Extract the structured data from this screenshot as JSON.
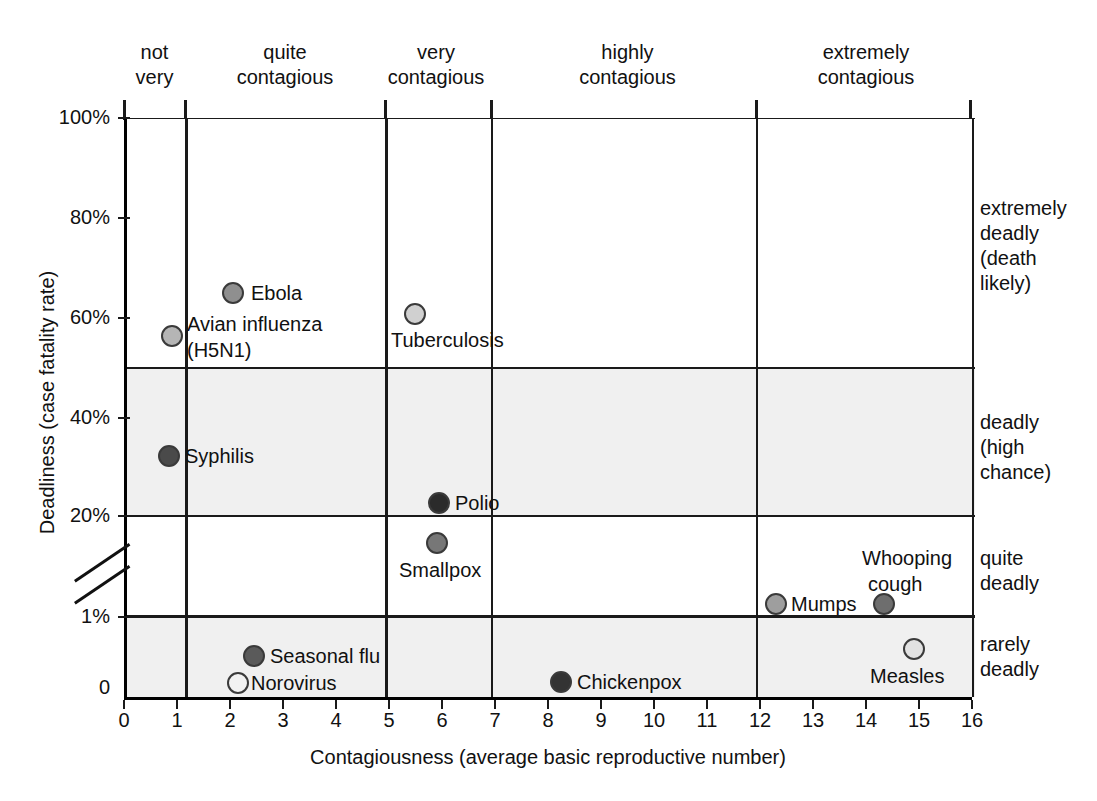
{
  "chart_data": {
    "type": "scatter",
    "title": "",
    "xlabel": "Contagiousness (average basic reproductive number)",
    "ylabel": "Deadliness (case fatality rate)",
    "xlim": [
      0,
      16
    ],
    "xticks": [
      "0",
      "1",
      "2",
      "3",
      "4",
      "5",
      "6",
      "7",
      "8",
      "9",
      "10",
      "11",
      "12",
      "13",
      "14",
      "15",
      "16"
    ],
    "yticks": [
      "100%",
      "80%",
      "60%",
      "40%",
      "20%",
      "1%",
      "0"
    ],
    "y_axis_note": "broken axis between 20% and 1%",
    "grid": true,
    "legend": "none",
    "points": [
      {
        "name": "Ebola",
        "x": 2.0,
        "y": 70,
        "color": "#8f8f8f",
        "label_pos": "right"
      },
      {
        "name": "Avian influenza\n(H5N1)",
        "x": 0.85,
        "y": 61.5,
        "color": "#b5b5b5",
        "label_pos": "right"
      },
      {
        "name": "Tuberculosis",
        "x": 5.45,
        "y": 65.5,
        "color": "#d0d0d0",
        "label_pos": "below"
      },
      {
        "name": "Syphilis",
        "x": 0.8,
        "y": 32.5,
        "color": "#4a4a4a",
        "label_pos": "right"
      },
      {
        "name": "Polio",
        "x": 5.9,
        "y": 22.5,
        "color": "#2b2b2b",
        "label_pos": "right"
      },
      {
        "name": "Smallpox",
        "x": 5.85,
        "y": 17.5,
        "color": "#777777",
        "label_pos": "below"
      },
      {
        "name": "Mumps",
        "x": 12.25,
        "y": 1.3,
        "color": "#9e9e9e",
        "label_pos": "right"
      },
      {
        "name": "Whooping\ncough",
        "x": 14.3,
        "y": 1.3,
        "color": "#6e6e6e",
        "label_pos": "above"
      },
      {
        "name": "Measles",
        "x": 14.85,
        "y": 0.55,
        "color": "#e2e2e2",
        "label_pos": "below"
      },
      {
        "name": "Seasonal flu",
        "x": 2.4,
        "y": 0.45,
        "color": "#5a5a5a",
        "label_pos": "right"
      },
      {
        "name": "Norovirus",
        "x": 2.1,
        "y": 0.1,
        "color": "#f2f2f2",
        "label_pos": "right"
      },
      {
        "name": "Chickenpox",
        "x": 8.2,
        "y": 0.12,
        "color": "#333333",
        "label_pos": "right"
      }
    ],
    "x_categories": [
      {
        "label": "not\nvery",
        "from": 0,
        "to": 1
      },
      {
        "label": "quite\ncontagious",
        "from": 1,
        "to": 5
      },
      {
        "label": "very\ncontagious",
        "from": 5,
        "to": 7
      },
      {
        "label": "highly\ncontagious",
        "from": 7,
        "to": 12
      },
      {
        "label": "extremely\ncontagious",
        "from": 12,
        "to": 16
      }
    ],
    "y_categories": [
      {
        "label": "extremely\ndeadly\n(death\nlikely)",
        "from": 50,
        "to": 100
      },
      {
        "label": "deadly\n(high\nchance)",
        "from": 20,
        "to": 50
      },
      {
        "label": "quite\ndeadly",
        "from": 1,
        "to": 20
      },
      {
        "label": "rarely\ndeadly",
        "from": 0,
        "to": 1
      }
    ]
  },
  "axes": {
    "x_title": "Contagiousness (average basic reproductive number)",
    "y_title": "Deadliness (case fatality rate)",
    "x_ticks": [
      "0",
      "1",
      "2",
      "3",
      "4",
      "5",
      "6",
      "7",
      "8",
      "9",
      "10",
      "11",
      "12",
      "13",
      "14",
      "15",
      "16"
    ],
    "y_ticks": [
      "100%",
      "80%",
      "60%",
      "40%",
      "20%",
      "1%",
      "0"
    ]
  },
  "top_headers": [
    {
      "line1": "not",
      "line2": "very"
    },
    {
      "line1": "quite",
      "line2": "contagious"
    },
    {
      "line1": "very",
      "line2": "contagious"
    },
    {
      "line1": "highly",
      "line2": "contagious"
    },
    {
      "line1": "extremely",
      "line2": "contagious"
    }
  ],
  "right_labels": [
    {
      "text": "extremely\ndeadly\n(death\nlikely)"
    },
    {
      "text": "deadly\n(high\nchance)"
    },
    {
      "text": "quite\ndeadly"
    },
    {
      "text": "rarely\ndeadly"
    }
  ],
  "point_labels": {
    "ebola": "Ebola",
    "avian_1": "Avian influenza",
    "avian_2": "(H5N1)",
    "tuberculosis": "Tuberculosis",
    "syphilis": "Syphilis",
    "polio": "Polio",
    "smallpox": "Smallpox",
    "mumps": "Mumps",
    "whooping_1": "Whooping",
    "whooping_2": "cough",
    "measles": "Measles",
    "seasonal_flu": "Seasonal flu",
    "norovirus": "Norovirus",
    "chickenpox": "Chickenpox"
  },
  "colors": {
    "axis": "#1a1a1a",
    "band": "#f0f0f0",
    "background": "#ffffff",
    "marker_stroke": "#3a3a3a"
  }
}
